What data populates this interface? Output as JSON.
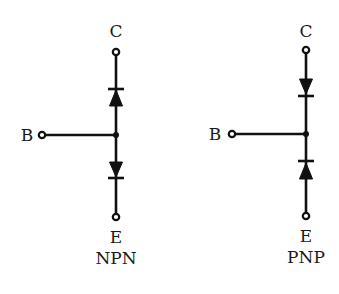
{
  "diagram": {
    "title": "",
    "colors": {
      "line": "#111111",
      "text": "#1a1a1a",
      "background": "#ffffff"
    },
    "npn": {
      "name": "NPN",
      "collector_label": "C",
      "base_label": "B",
      "emitter_label": "E",
      "type_label": "NPN",
      "upper_diode": "base-to-collector (anode at base, cathode toward collector)",
      "lower_diode": "base-to-emitter (anode at base, cathode toward emitter)"
    },
    "pnp": {
      "name": "PNP",
      "collector_label": "C",
      "base_label": "B",
      "emitter_label": "E",
      "type_label": "PNP",
      "upper_diode": "collector-to-base (anode at collector, cathode toward base)",
      "lower_diode": "emitter-to-base (anode at emitter, cathode toward base)"
    }
  }
}
